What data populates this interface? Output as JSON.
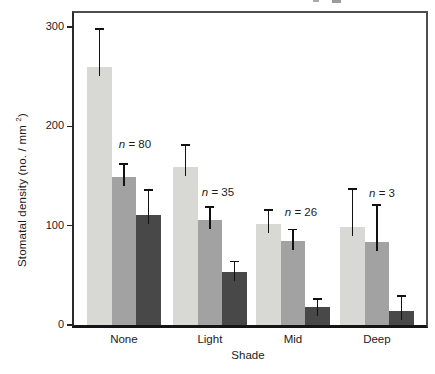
{
  "figure": {
    "background": "#ffffff",
    "frame_color": "#4d4d4d"
  },
  "axes": {
    "ylabel_main": "Stomatal density (no. / mm ",
    "ylabel_sup": "2",
    "ylabel_close": ")",
    "xlabel": "Shade"
  },
  "chart_data": {
    "type": "bar",
    "title": "",
    "xlabel": "Shade",
    "ylabel": "Stomatal density (no. / mm^2)",
    "categories": [
      "None",
      "Light",
      "Mid",
      "Deep"
    ],
    "series": [
      {
        "name": "light-gray-bars",
        "color": "#d8d8d5",
        "values": [
          260,
          159,
          102,
          99
        ],
        "errors_up": [
          38,
          22,
          14,
          38
        ]
      },
      {
        "name": "mid-gray-bars",
        "color": "#a2a2a2",
        "values": [
          149,
          106,
          85,
          84
        ],
        "errors_up": [
          13,
          13,
          11,
          37
        ]
      },
      {
        "name": "dark-gray-bars",
        "color": "#484848",
        "values": [
          111,
          53,
          18,
          14
        ],
        "errors_up": [
          25,
          11,
          8,
          15
        ]
      }
    ],
    "annotations": [
      {
        "category": "None",
        "label": "n = 80",
        "x_px": 61,
        "y_px": 131
      },
      {
        "category": "Light",
        "label": "n = 35",
        "x_px": 144,
        "y_px": 179
      },
      {
        "category": "Mid",
        "label": "n = 26",
        "x_px": 227,
        "y_px": 199
      },
      {
        "category": "Deep",
        "label": "n = 3",
        "x_px": 308,
        "y_px": 180
      }
    ],
    "ylim": [
      0,
      314
    ],
    "yticks": [
      0,
      100,
      200,
      300
    ],
    "grid": false,
    "legend": "none",
    "error_bars": "upper-only with caps"
  }
}
